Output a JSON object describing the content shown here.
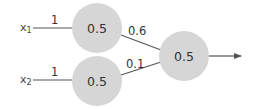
{
  "diagram": {
    "type": "neural-network",
    "colors": {
      "node_fill": "#d6d6d6",
      "edge": "#555555",
      "text": "#333333"
    },
    "inputs": [
      {
        "name": "x",
        "subscript": "1",
        "weight_to_hidden": "1"
      },
      {
        "name": "x",
        "subscript": "2",
        "weight_to_hidden": "1"
      }
    ],
    "hidden_nodes": [
      {
        "value": "0.5",
        "weight_to_output": "0.6"
      },
      {
        "value": "0.5",
        "weight_to_output": "0.1"
      }
    ],
    "output_node": {
      "value": "0.5"
    }
  }
}
